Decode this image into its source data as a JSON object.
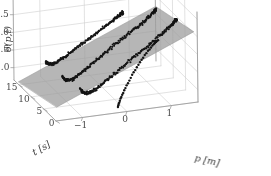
{
  "figure": {
    "background_color": "#ffffff",
    "plane_color": "#9a9a9a",
    "plane_opacity": 0.72,
    "grid_color": "#cfcfcf",
    "axis_color": "#9e9e9e",
    "marker_color": "#141414",
    "text_color": "#4a4a4a"
  },
  "chart_data": {
    "type": "scatter",
    "title": "",
    "subtitle": "",
    "projection": "3d",
    "xlabel": "p [m]",
    "ylabel": "t [s]",
    "zlabel": "δ(p,t)",
    "xlim": [
      -1.6,
      1.6
    ],
    "ylim": [
      0,
      17
    ],
    "zlim": [
      -1.35,
      1.2
    ],
    "xticks": [
      -1,
      0,
      1
    ],
    "xticklabels": [
      "−1",
      "0",
      "1"
    ],
    "yticks": [
      0,
      5,
      10,
      15
    ],
    "yticklabels": [
      "0",
      "5",
      "10",
      "15"
    ],
    "zticks": [
      -1.0,
      -0.5,
      0.0,
      0.5,
      1.0
    ],
    "zticklabels": [
      "−1.0",
      "−0.5",
      "0.0",
      "0.5",
      "1.0"
    ],
    "grid": true,
    "legend": null,
    "annotations": [],
    "elev": 22,
    "azim": -58,
    "plane": {
      "label": "fitted plane",
      "z_intercept": -0.18,
      "slope_p": 0.52,
      "slope_t": -0.022,
      "p_range": [
        -1.55,
        1.55
      ],
      "t_range": [
        0.5,
        16.0
      ],
      "color": "#9a9a9a",
      "opacity": 0.72
    },
    "series": [
      {
        "name": "run-1",
        "t_value": 14.0,
        "style": "dense-dots",
        "marker_size": 2.0,
        "noise": 0.055,
        "p": [
          -1.05,
          -1.0,
          -0.93,
          -0.84,
          -0.74,
          -0.63,
          -0.5,
          -0.36,
          -0.2,
          -0.03,
          0.14,
          0.3,
          0.44,
          0.55,
          0.63,
          0.68,
          0.7
        ],
        "delta": [
          -0.72,
          -0.78,
          -0.81,
          -0.8,
          -0.74,
          -0.66,
          -0.56,
          -0.45,
          -0.33,
          -0.2,
          -0.07,
          0.06,
          0.17,
          0.26,
          0.32,
          0.36,
          0.38
        ]
      },
      {
        "name": "run-2",
        "t_value": 10.0,
        "style": "dense-dots",
        "marker_size": 2.1,
        "noise": 0.06,
        "p": [
          -0.9,
          -0.84,
          -0.76,
          -0.66,
          -0.54,
          -0.4,
          -0.24,
          -0.06,
          0.13,
          0.33,
          0.53,
          0.72,
          0.89,
          1.03,
          1.14,
          1.2,
          1.23
        ],
        "delta": [
          -0.9,
          -0.98,
          -1.02,
          -1.0,
          -0.92,
          -0.8,
          -0.66,
          -0.5,
          -0.33,
          -0.16,
          0.0,
          0.16,
          0.3,
          0.43,
          0.54,
          0.62,
          0.66
        ]
      },
      {
        "name": "run-3",
        "t_value": 6.0,
        "style": "dense-dots",
        "marker_size": 2.1,
        "noise": 0.06,
        "p": [
          -0.72,
          -0.66,
          -0.58,
          -0.47,
          -0.34,
          -0.19,
          -0.02,
          0.17,
          0.37,
          0.58,
          0.78,
          0.97,
          1.14,
          1.28,
          1.38,
          1.44,
          1.47
        ],
        "delta": [
          -1.02,
          -1.1,
          -1.14,
          -1.12,
          -1.04,
          -0.92,
          -0.77,
          -0.6,
          -0.42,
          -0.24,
          -0.07,
          0.1,
          0.25,
          0.39,
          0.5,
          0.58,
          0.62
        ]
      },
      {
        "name": "run-4",
        "t_value": 1.5,
        "style": "sparse-dots",
        "marker_size": 2.4,
        "noise": 0.02,
        "p": [
          -0.12,
          -0.1,
          -0.07,
          -0.03,
          0.02,
          0.08,
          0.15,
          0.22,
          0.3,
          0.38,
          0.46,
          0.54,
          0.62,
          0.69,
          0.75,
          0.8
        ],
        "delta": [
          -1.3,
          -1.22,
          -1.12,
          -1.0,
          -0.87,
          -0.73,
          -0.58,
          -0.43,
          -0.28,
          -0.13,
          0.0,
          0.12,
          0.23,
          0.32,
          0.39,
          0.44
        ]
      }
    ]
  }
}
